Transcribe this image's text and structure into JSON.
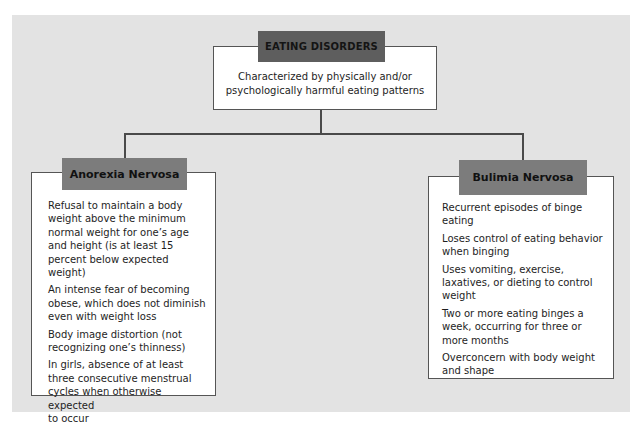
{
  "diagram": {
    "title": "EATING DISORDERS",
    "description": "Characterized by physically and/or\npsychologically harmful eating patterns",
    "colors": {
      "panel_background": "#e3e3e3",
      "title_header": "#5e5e5e",
      "category_header": "#7c7c7c",
      "box_background": "#ffffff",
      "connector": "#4a4a4a"
    },
    "categories": [
      {
        "label": "Anorexia Nervosa",
        "criteria": [
          "Refusal to maintain a body\nweight above the minimum\nnormal weight for one’s age\nand height (is at least 15\npercent below expected weight)",
          "An intense fear of becoming\nobese, which does not diminish\neven with weight loss",
          "Body image distortion (not\nrecognizing one’s thinness)",
          "In girls, absence of at least\nthree consecutive menstrual\ncycles when otherwise expected\nto occur"
        ]
      },
      {
        "label": "Bulimia Nervosa",
        "criteria": [
          "Recurrent episodes of binge\neating",
          "Loses control of eating behavior\nwhen binging",
          "Uses vomiting, exercise,\nlaxatives, or dieting to control\nweight",
          "Two or more eating binges a\nweek, occurring for three or\nmore months",
          "Overconcern with body weight\nand shape"
        ]
      }
    ]
  }
}
